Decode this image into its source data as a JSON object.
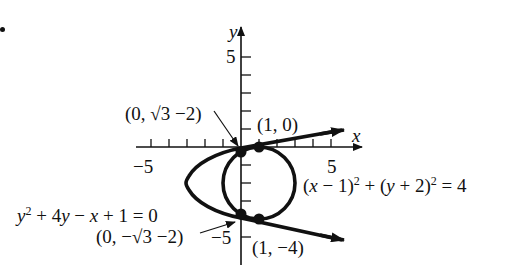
{
  "figure": {
    "bullet": "•",
    "axes": {
      "x_label": "x",
      "y_label": "y",
      "x_ticks": {
        "neg": "−5",
        "pos": "5"
      },
      "y_ticks": {
        "pos": "5",
        "neg": "−5"
      },
      "x_range": [
        -5.5,
        6.5
      ],
      "y_range": [
        -5.5,
        5.5
      ]
    },
    "curves": {
      "circle": {
        "equation_parts": {
          "a": "(",
          "b": "x",
          "c": " − 1)",
          "d": "2",
          "e": " + (",
          "f": "y",
          "g": " + 2)",
          "h": "2",
          "i": " = 4"
        },
        "center": [
          1,
          -2
        ],
        "radius": 2
      },
      "parabola": {
        "equation_parts": {
          "a": "y",
          "b": "2",
          "c": " + 4",
          "d": "y",
          "e": " − ",
          "f": "x",
          "g": " + 1 = 0"
        },
        "vertex": [
          -3,
          -2
        ]
      }
    },
    "points": [
      {
        "label": "(0, √3 −2)",
        "x": 0,
        "y": -0.268
      },
      {
        "label": "(1, 0)",
        "x": 1,
        "y": 0
      },
      {
        "label": "(0, −√3 −2)",
        "x": 0,
        "y": -3.732
      },
      {
        "label": "(1, −4)",
        "x": 1,
        "y": -4
      }
    ],
    "colors": {
      "ink": "#111111",
      "background": "#ffffff"
    }
  }
}
